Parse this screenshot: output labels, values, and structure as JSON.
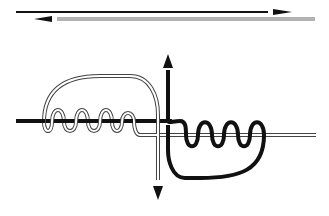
{
  "diagram": {
    "type": "knot-tying-diagram",
    "colors": {
      "background": "#ffffff",
      "rope_dark": "#111111",
      "rope_light_outline": "#444444",
      "rope_light_fill": "#ffffff"
    },
    "top_panel": {
      "step": "ropes laid parallel",
      "ropes": [
        {
          "name": "dark-rope",
          "direction": "right",
          "style": "solid-black"
        },
        {
          "name": "light-rope",
          "direction": "left",
          "style": "hollow-outline"
        }
      ]
    },
    "bottom_panel": {
      "step": "each rope wrapped around the other",
      "left_wrap": {
        "rope": "light-rope",
        "wraps": 3,
        "around": "dark-rope",
        "exit_arrow": "down"
      },
      "right_wrap": {
        "rope": "dark-rope",
        "wraps": 3,
        "around": "light-rope",
        "exit_arrow": "up"
      }
    }
  }
}
